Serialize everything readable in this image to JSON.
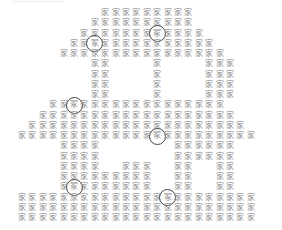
{
  "puzzle": {
    "description": "Find the odd characters hidden in a house made of repeated characters",
    "base_char": "家",
    "odd_char": "冢",
    "char_color": "#8a8a8a",
    "ring_color": "#444444",
    "grid": {
      "origin_x": 22,
      "origin_y": 13,
      "pitch_x": 10.4,
      "pitch_y": 10.25,
      "rows": [
        "........#########.......",
        ".......##########.......",
        "......############......",
        ".....##############.....",
        "....################....",
        ".......##....#....###...",
        ".......##....#....###...",
        ".......##....#....###...",
        ".......##....#....###...",
        "...#################....",
        "..###################...",
        ".#####################..",
        "#######################.",
        "....####.......######...",
        "....####.......######...",
        "....####..###..##..##...",
        "....#########..##..##...",
        "....#########..##..##...",
        "#######################.",
        "#######################.",
        "#######################."
      ]
    },
    "marked": [
      {
        "row": 3,
        "col": 7
      },
      {
        "row": 2,
        "col": 13
      },
      {
        "row": 9,
        "col": 5
      },
      {
        "row": 8,
        "col": 15
      },
      {
        "row": 12,
        "col": 13
      },
      {
        "row": 14,
        "col": 9
      },
      {
        "row": 17,
        "col": 5
      },
      {
        "row": 18,
        "col": 14
      }
    ]
  }
}
